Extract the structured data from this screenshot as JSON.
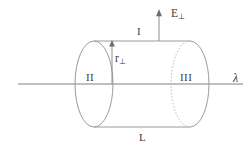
{
  "figure": {
    "kind": "physics-diagram",
    "background_color": "#ffffff",
    "line_color": "#8c8c8c",
    "axis_color": "#808080",
    "text_color": "#3c3c3c",
    "labels": {
      "field_arrow": {
        "symbol": "E",
        "subscript": "⊥",
        "name": "E-perpendicular"
      },
      "surface_top": "I",
      "surface_left_cap": "II",
      "surface_right_cap": "III",
      "radius_arrow": {
        "symbol": "r",
        "subscript": "⊥",
        "name": "r-perpendicular"
      },
      "line_charge": "λ",
      "length": "L"
    },
    "geometry": {
      "axis": {
        "x1": 18,
        "y": 84,
        "x2": 243
      },
      "left_ellipse": {
        "cx": 94,
        "cy": 84,
        "rx": 19,
        "ry": 43
      },
      "right_ellipse": {
        "cx": 190,
        "cy": 84,
        "rx": 19,
        "ry": 43
      },
      "top_line": {
        "x1": 94,
        "y": 41,
        "x2": 190
      },
      "bottom_line": {
        "x1": 94,
        "y": 127,
        "x2": 190
      },
      "radius_arrow": {
        "x": 112,
        "y_from": 84,
        "y_to": 41
      },
      "field_arrow": {
        "x": 159,
        "y_from": 41,
        "y_to": 10
      }
    }
  }
}
